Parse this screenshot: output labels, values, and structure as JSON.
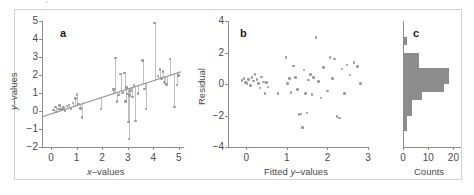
{
  "figure": {
    "top_clipped_text": "——  —— , —————  — —— — —",
    "background": "#ffffff",
    "frame_color": "#d2d2d2",
    "marker_color": "#9a9a9a",
    "line_color": "#8e8e8e",
    "hist_fill": "#8d8d8d",
    "axis_color": "#8d8d8d"
  },
  "chart_data": [
    {
      "type": "scatter",
      "panel_label": "a",
      "title": "",
      "xlabel": "x–values",
      "ylabel": "y–values",
      "xlim": [
        -0.35,
        5.2
      ],
      "ylim": [
        -2,
        5
      ],
      "xticks": [
        0,
        1,
        2,
        3,
        4,
        5
      ],
      "yticks": [
        -2,
        -1,
        0,
        1,
        2,
        3,
        4,
        5
      ],
      "xticklabels": [
        "0",
        "1",
        "2",
        "3",
        "4",
        "5"
      ],
      "yticklabels": [
        "−2",
        "−1",
        "0",
        "1",
        "2",
        "3",
        "4",
        "5"
      ],
      "grid": false,
      "legend": "none",
      "fit_line": {
        "intercept": -0.15,
        "slope": 0.46
      },
      "residual_drop_lines": true,
      "x": [
        0.1,
        0.18,
        0.22,
        0.3,
        0.34,
        0.42,
        0.48,
        0.55,
        0.62,
        0.7,
        0.78,
        0.86,
        0.95,
        1.02,
        1.08,
        1.15,
        1.22,
        1.95,
        2.42,
        2.48,
        2.52,
        2.58,
        2.64,
        2.72,
        2.8,
        2.88,
        2.92,
        2.96,
        3.0,
        3.02,
        3.05,
        3.08,
        3.12,
        3.18,
        3.24,
        3.3,
        3.4,
        3.58,
        3.66,
        3.72,
        4.05,
        4.18,
        4.26,
        4.32,
        4.38,
        4.42,
        4.46,
        4.52,
        4.66,
        4.82,
        4.92,
        4.98
      ],
      "y": [
        0.05,
        0.22,
        -0.05,
        0.12,
        0.3,
        0.08,
        0.18,
        0.02,
        0.28,
        0.34,
        0.12,
        0.45,
        0.68,
        0.92,
        0.4,
        0.15,
        -0.35,
        0.1,
        1.18,
        1.22,
        2.95,
        0.52,
        0.88,
        2.05,
        1.0,
        2.1,
        0.52,
        1.3,
        0.95,
        -0.62,
        -1.55,
        0.86,
        1.1,
        0.78,
        1.42,
        -0.55,
        0.98,
        2.82,
        1.22,
        0.1,
        4.88,
        1.95,
        2.3,
        1.8,
        2.2,
        1.62,
        1.55,
        1.48,
        2.9,
        0.22,
        1.45,
        1.98
      ]
    },
    {
      "type": "scatter",
      "panel_label": "b",
      "title": "",
      "xlabel": "Fitted y–values",
      "ylabel": "Residual",
      "xlim": [
        -0.45,
        3.0
      ],
      "ylim": [
        -4,
        4
      ],
      "xticks": [
        0,
        1,
        2,
        3
      ],
      "yticks": [
        -4,
        -2,
        0,
        2,
        4
      ],
      "xticklabels": [
        "0",
        "1",
        "2",
        "3"
      ],
      "yticklabels": [
        "−4",
        "−2",
        "0",
        "2",
        "4"
      ],
      "grid": false,
      "legend": "none",
      "x": [
        -0.1,
        -0.06,
        -0.02,
        0.02,
        0.06,
        0.1,
        0.14,
        0.18,
        0.22,
        0.26,
        0.3,
        0.34,
        0.38,
        0.42,
        0.46,
        0.5,
        0.54,
        0.78,
        0.98,
        1.02,
        1.06,
        1.1,
        1.16,
        1.22,
        1.26,
        1.3,
        1.34,
        1.38,
        1.42,
        1.46,
        1.5,
        1.54,
        1.58,
        1.62,
        1.66,
        1.72,
        1.78,
        1.84,
        1.9,
        2.0,
        2.06,
        2.12,
        2.18,
        2.24,
        2.3,
        2.36,
        2.42,
        2.48,
        2.56,
        2.66,
        2.74,
        2.82
      ],
      "y": [
        0.22,
        0.35,
        0.1,
        0.05,
        0.28,
        -0.1,
        0.4,
        0.18,
        0.62,
        0.3,
        0.05,
        -0.25,
        0.45,
        0.12,
        -0.62,
        0.08,
        -0.2,
        -0.62,
        1.7,
        0.05,
        0.35,
        -0.55,
        1.15,
        0.42,
        -0.35,
        -1.95,
        -1.9,
        -2.75,
        0.88,
        -0.62,
        -1.85,
        0.25,
        0.6,
        -0.68,
        0.4,
        2.95,
        0.15,
        -0.9,
        1.05,
        -0.45,
        1.7,
        0.35,
        1.58,
        -2.05,
        -2.15,
        0.95,
        -0.6,
        1.2,
        0.58,
        1.35,
        1.1,
        0.05
      ]
    },
    {
      "type": "bar",
      "orientation": "horizontal",
      "panel_label": "c",
      "title": "",
      "xlabel": "Counts",
      "ylabel": "",
      "xlim": [
        0,
        23
      ],
      "ylim": [
        -4,
        4
      ],
      "xticks": [
        0,
        10,
        20
      ],
      "xticklabels": [
        "0",
        "10",
        "20"
      ],
      "grid": false,
      "legend": "none",
      "bin_edges": [
        -3.0,
        -2.5,
        -2.0,
        -1.5,
        -1.0,
        -0.5,
        0.0,
        0.5,
        1.0,
        1.5,
        2.0,
        2.5,
        3.0
      ],
      "categories": [
        "-3.0 to -2.5",
        "-2.5 to -2.0",
        "-2.0 to -1.5",
        "-1.5 to -1.0",
        "-1.0 to -0.5",
        "-0.5 to 0.0",
        "0.0 to 0.5",
        "0.5 to 1.0",
        "1.0 to 1.5",
        "1.5 to 2.0",
        "2.0 to 2.5",
        "2.5 to 3.0"
      ],
      "values": [
        1,
        1,
        3,
        3,
        7,
        16,
        18,
        18,
        6,
        6,
        0,
        1
      ]
    }
  ]
}
